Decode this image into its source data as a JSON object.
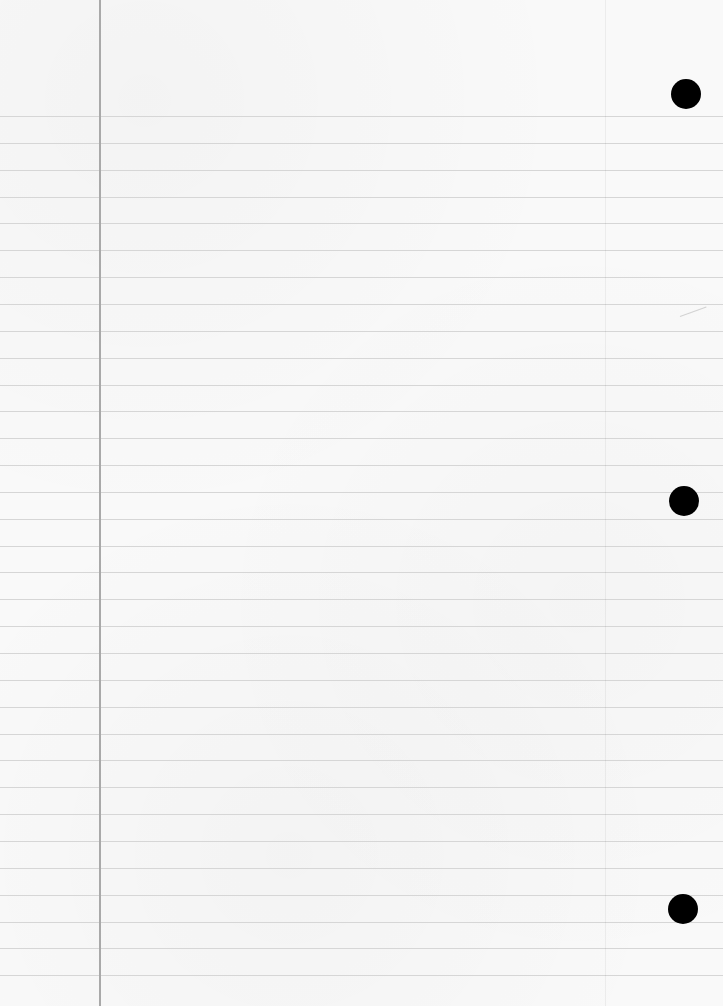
{
  "page": {
    "type": "lined-notebook-paper",
    "width": 723,
    "height": 1006,
    "background_color": "#f9f9f9",
    "rule_line_color": "#d6d6d6",
    "margin_line_color": "#a9a9a9",
    "hole_color": "#000000"
  },
  "rules": {
    "first_line_y": 116,
    "spacing": 26.85,
    "count": 33
  },
  "margin_line": {
    "x": 99
  },
  "faint_vertical_line": {
    "x": 605
  },
  "binder_holes": [
    {
      "cx": 686,
      "cy": 94,
      "r": 15
    },
    {
      "cx": 684,
      "cy": 501,
      "r": 15
    },
    {
      "cx": 683,
      "cy": 909,
      "r": 15
    }
  ],
  "faint_marks": {
    "ghost_text": "",
    "stroke": {
      "x": 680,
      "y": 316,
      "width": 28,
      "angle": -20
    }
  }
}
